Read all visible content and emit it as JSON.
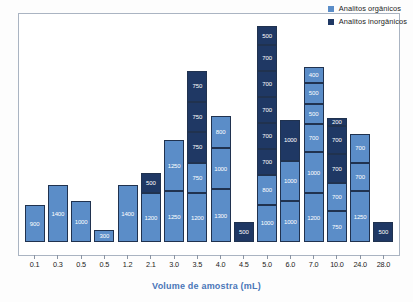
{
  "chart_data": {
    "type": "bar",
    "stacked": true,
    "title": "",
    "xlabel": "Volume de amostra (mL)",
    "ylabel": "",
    "grid": false,
    "legend_position": "top-right",
    "ylim": [
      0,
      5600
    ],
    "colors": {
      "organicos": "#5B8DC8",
      "inorganicos": "#1F3864",
      "segment_border": "#20324f",
      "xlabel_color": "#4a76b8",
      "frame": "#aab4c2"
    },
    "legend": [
      {
        "label": "Analitos orgânicos",
        "color": "#5B8DC8",
        "series": "organicos"
      },
      {
        "label": "Analitos inorgânicos",
        "color": "#1F3864",
        "series": "inorganicos"
      }
    ],
    "categories": [
      "0.1",
      "0.3",
      "0.5",
      "0.5",
      "1.2",
      "2.1",
      "3.0",
      "3.5",
      "4.0",
      "4.5",
      "5.0",
      "6.0",
      "7.0",
      "10.0",
      "24.0",
      "28.0"
    ],
    "bars": [
      {
        "category": "0.1",
        "total": 900,
        "segments": [
          {
            "value": 900,
            "series": "organicos"
          }
        ]
      },
      {
        "category": "0.3",
        "total": 1400,
        "segments": [
          {
            "value": 1400,
            "series": "organicos"
          }
        ]
      },
      {
        "category": "0.5",
        "total": 1000,
        "segments": [
          {
            "value": 1000,
            "series": "organicos"
          }
        ]
      },
      {
        "category": "0.5",
        "total": 300,
        "segments": [
          {
            "value": 300,
            "series": "organicos"
          }
        ]
      },
      {
        "category": "1.2",
        "total": 1400,
        "segments": [
          {
            "value": 1400,
            "series": "organicos"
          }
        ]
      },
      {
        "category": "2.1",
        "total": 1700,
        "segments": [
          {
            "value": 1200,
            "series": "organicos"
          },
          {
            "value": 500,
            "series": "inorganicos"
          }
        ]
      },
      {
        "category": "3.0",
        "total": 2500,
        "segments": [
          {
            "value": 1250,
            "series": "organicos"
          },
          {
            "value": 1250,
            "series": "organicos"
          }
        ]
      },
      {
        "category": "3.5",
        "total": 4200,
        "segments": [
          {
            "value": 1200,
            "series": "organicos"
          },
          {
            "value": 750,
            "series": "organicos"
          },
          {
            "value": 750,
            "series": "inorganicos"
          },
          {
            "value": 750,
            "series": "inorganicos"
          },
          {
            "value": 750,
            "series": "inorganicos"
          }
        ]
      },
      {
        "category": "4.0",
        "total": 3100,
        "segments": [
          {
            "value": 1300,
            "series": "organicos"
          },
          {
            "value": 1000,
            "series": "organicos"
          },
          {
            "value": 800,
            "series": "organicos"
          }
        ]
      },
      {
        "category": "4.5",
        "total": 500,
        "segments": [
          {
            "value": 500,
            "series": "inorganicos"
          }
        ]
      },
      {
        "category": "5.0",
        "total": 5300,
        "segments": [
          {
            "value": 1000,
            "series": "organicos"
          },
          {
            "value": 800,
            "series": "organicos"
          },
          {
            "value": 700,
            "series": "inorganicos"
          },
          {
            "value": 700,
            "series": "inorganicos"
          },
          {
            "value": 700,
            "series": "inorganicos"
          },
          {
            "value": 700,
            "series": "inorganicos"
          },
          {
            "value": 700,
            "series": "inorganicos"
          },
          {
            "value": 500,
            "series": "inorganicos"
          }
        ]
      },
      {
        "category": "6.0",
        "total": 3000,
        "segments": [
          {
            "value": 1000,
            "series": "organicos"
          },
          {
            "value": 1000,
            "series": "organicos"
          },
          {
            "value": 1000,
            "series": "inorganicos"
          }
        ]
      },
      {
        "category": "7.0",
        "total": 4300,
        "segments": [
          {
            "value": 1200,
            "series": "organicos"
          },
          {
            "value": 1000,
            "series": "organicos"
          },
          {
            "value": 700,
            "series": "organicos"
          },
          {
            "value": 500,
            "series": "organicos"
          },
          {
            "value": 500,
            "series": "organicos"
          },
          {
            "value": 400,
            "series": "organicos"
          }
        ]
      },
      {
        "category": "10.0",
        "total": 3050,
        "segments": [
          {
            "value": 750,
            "series": "organicos"
          },
          {
            "value": 700,
            "series": "organicos"
          },
          {
            "value": 700,
            "series": "inorganicos"
          },
          {
            "value": 700,
            "series": "inorganicos"
          },
          {
            "value": 200,
            "series": "inorganicos"
          }
        ]
      },
      {
        "category": "24.0",
        "total": 2650,
        "segments": [
          {
            "value": 1250,
            "series": "organicos"
          },
          {
            "value": 700,
            "series": "organicos"
          },
          {
            "value": 700,
            "series": "organicos"
          }
        ]
      },
      {
        "category": "28.0",
        "total": 500,
        "segments": [
          {
            "value": 500,
            "series": "inorganicos"
          }
        ]
      }
    ]
  }
}
